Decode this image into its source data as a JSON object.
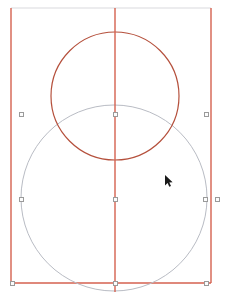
{
  "app": {
    "surface_name": "drawing-canvas",
    "width": 229,
    "height": 296,
    "background_color": "#ffffff"
  },
  "colors": {
    "construction_red": "#d4614f",
    "construction_red_light": "#e08a7a",
    "circle_red": "#b5503c",
    "circle_gray": "#b9bcc4",
    "frame_top_gray": "#e6e6e8",
    "handle_stroke": "#9a9a9a",
    "handle_fill": "#fcfcfc",
    "cursor": "#1a1a1a"
  },
  "shapes": {
    "frame": {
      "label": "selection-frame-rectangle",
      "left": 11,
      "right": 211,
      "top": 8,
      "bottom": 283,
      "stroke_width": 1.4
    },
    "center_guide": {
      "label": "vertical-center-guide",
      "x": 115,
      "y1": 8,
      "y2": 292,
      "stroke_width": 1.4
    },
    "circle_top": {
      "label": "upper-circle-selected",
      "cx": 115,
      "cy": 96,
      "r": 64,
      "stroke_width": 1.2,
      "state": "selected"
    },
    "circle_bottom": {
      "label": "lower-circle",
      "cx": 114,
      "cy": 198,
      "r": 93,
      "stroke_width": 1.0,
      "state": "unselected"
    }
  },
  "handles": [
    {
      "name": "handle-mid-left",
      "x": 21,
      "y": 114
    },
    {
      "name": "handle-mid-center",
      "x": 115,
      "y": 114
    },
    {
      "name": "handle-mid-right",
      "x": 206,
      "y": 114
    },
    {
      "name": "handle-lower-left",
      "x": 21,
      "y": 199
    },
    {
      "name": "handle-lower-center",
      "x": 115,
      "y": 199
    },
    {
      "name": "handle-lower-right-inner",
      "x": 205,
      "y": 199
    },
    {
      "name": "handle-lower-right-outer",
      "x": 217,
      "y": 199
    },
    {
      "name": "handle-bottom-left",
      "x": 12,
      "y": 283
    },
    {
      "name": "handle-bottom-center",
      "x": 115,
      "y": 283
    },
    {
      "name": "handle-bottom-right",
      "x": 206,
      "y": 283
    }
  ],
  "cursor": {
    "name": "mouse-pointer",
    "x": 164,
    "y": 174
  }
}
